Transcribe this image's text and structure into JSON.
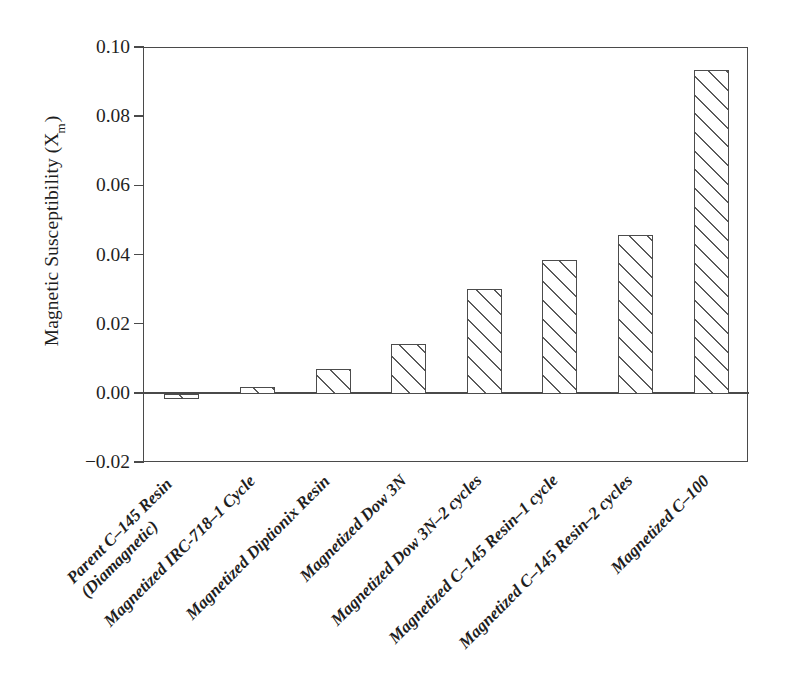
{
  "chart_data": {
    "type": "bar",
    "title": "",
    "xlabel": "",
    "ylabel": "Magnetic Susceptibility (X",
    "ylabel_sub": "m",
    "ylabel_suffix": ")",
    "categories": [
      "Parent C–145 Resin (Diamagnetic)",
      "Magnetized IRC-718–1 Cycle",
      "Magnetized Diptionix Resin",
      "Magnetized Dow 3N",
      "Magnetized Dow 3N–2 cycles",
      "Magnetized C–145 Resin–1 cycle",
      "Magnetized C–145 Resin–2 cycles",
      "Magnetized C–100"
    ],
    "category_lines": [
      [
        "Parent C–145 Resin",
        "(Diamagnetic)"
      ],
      [
        "Magnetized IRC-718–1 Cycle",
        ""
      ],
      [
        "Magnetized Diptionix Resin",
        ""
      ],
      [
        "Magnetized Dow 3N",
        ""
      ],
      [
        "Magnetized Dow 3N–2 cycles",
        ""
      ],
      [
        "Magnetized C–145 Resin–1 cycle",
        ""
      ],
      [
        "Magnetized C–145 Resin–2 cycles",
        ""
      ],
      [
        "Magnetized C–100",
        ""
      ]
    ],
    "values": [
      -0.0015,
      0.0021,
      0.0071,
      0.0143,
      0.0303,
      0.0388,
      0.0459,
      0.0935
    ],
    "ylim": [
      -0.02,
      0.1
    ],
    "ytick_values": [
      0.1,
      0.08,
      0.06,
      0.04,
      0.02,
      0.0,
      -0.02
    ],
    "ytick_labels": [
      "0.10",
      "0.08",
      "0.06",
      "0.04",
      "0.02",
      "0.00",
      "−0.02"
    ],
    "grid": false,
    "legend": null,
    "bar_fill": "hatch-diagonal-45",
    "bar_edge_color": "#4c4c4c",
    "axis_color": "#4a4a4a",
    "background_color": "#ffffff"
  }
}
